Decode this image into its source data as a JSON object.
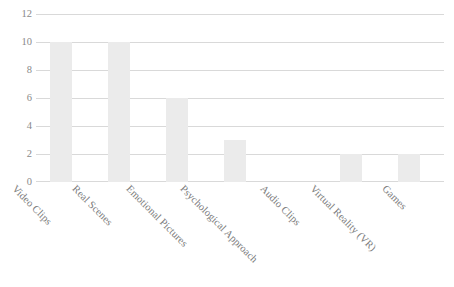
{
  "chart_data": {
    "type": "bar",
    "title": "",
    "subtitle": "",
    "xlabel": "",
    "ylabel": "",
    "ylim": [
      0,
      12
    ],
    "yticks": [
      0,
      2,
      4,
      6,
      8,
      10,
      12
    ],
    "grid": true,
    "legend": false,
    "legend_position": "none",
    "categories": [
      "Video Clips",
      "Real Scenes",
      "Emotional Pictures",
      "Psychological Approach",
      "Audio Clips",
      "Virtual Reality (VR)",
      "Games"
    ],
    "values": [
      10,
      10,
      6,
      3,
      2,
      2,
      2
    ],
    "series": [
      {
        "name": "Count",
        "values": [
          10,
          10,
          6,
          3,
          2,
          2,
          2
        ]
      }
    ],
    "colors": {
      "bar_fill": "#ebebeb",
      "gridline": "#d9d9d9",
      "axis_text": "#8a8a8a",
      "category_text": "#7c7c7c",
      "background": "#ffffff"
    }
  }
}
